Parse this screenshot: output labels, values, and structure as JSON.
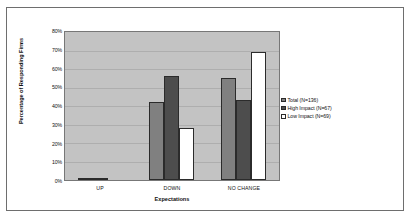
{
  "chart_data": {
    "type": "bar",
    "title": "",
    "xlabel": "Expectations",
    "ylabel": "Percentage of Responding Firms",
    "categories": [
      "UP",
      "DOWN",
      "NO CHANGE"
    ],
    "ylim": [
      0,
      80
    ],
    "ytick_labels": [
      "0%",
      "10%",
      "20%",
      "30%",
      "40%",
      "50%",
      "60%",
      "70%",
      "80%"
    ],
    "ytick_values": [
      0,
      10,
      20,
      30,
      40,
      50,
      60,
      70,
      80
    ],
    "grid": true,
    "legend_position": "right",
    "series": [
      {
        "name": "Total (N=136)",
        "color": "#808080",
        "values": [
          1,
          42,
          55
        ]
      },
      {
        "name": "High Impact (N=67)",
        "color": "#4d4d4d",
        "values": [
          1,
          56,
          43
        ]
      },
      {
        "name": "Low Impact (N=69)",
        "color": "#ffffff",
        "values": [
          0,
          28,
          69
        ]
      }
    ]
  },
  "colors": {
    "plot_background": "#c3c3c3",
    "gridline": "#aeaeae",
    "frame": "#6e6e6e",
    "bar_outline": "#2b2b2b",
    "page_background": "#ffffff"
  }
}
